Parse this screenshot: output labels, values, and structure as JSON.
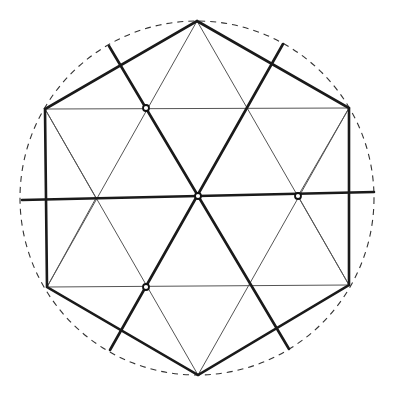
{
  "diagram": {
    "colors": {
      "ink": "#1a1a1a",
      "thin": "#555555",
      "background": "#ffffff"
    },
    "circle": {
      "cx": 197,
      "cy": 198,
      "r": 177,
      "style": "dashed"
    },
    "hexagon": {
      "vertices": [
        [
          197,
          21
        ],
        [
          349,
          108
        ],
        [
          349,
          285
        ],
        [
          198,
          375
        ],
        [
          47,
          287
        ],
        [
          45,
          109
        ]
      ]
    },
    "thin_lines": [
      [
        [
          45,
          109
        ],
        [
          349,
          108
        ]
      ],
      [
        [
          47,
          287
        ],
        [
          349,
          285
        ]
      ],
      [
        [
          197,
          21
        ],
        [
          47,
          287
        ]
      ],
      [
        [
          197,
          21
        ],
        [
          349,
          285
        ]
      ],
      [
        [
          198,
          375
        ],
        [
          45,
          109
        ]
      ],
      [
        [
          198,
          375
        ],
        [
          349,
          108
        ]
      ],
      [
        [
          45,
          109
        ],
        [
          96,
          198
        ]
      ],
      [
        [
          349,
          108
        ],
        [
          298,
          196
        ]
      ],
      [
        [
          47,
          287
        ],
        [
          96,
          198
        ]
      ],
      [
        [
          349,
          285
        ],
        [
          298,
          196
        ]
      ]
    ],
    "thick_lines": [
      {
        "name": "horizontal-axis",
        "from": [
          22,
          200
        ],
        "to": [
          374,
          192
        ]
      },
      {
        "name": "diagonal-upper-left-to-lower-right",
        "from": [
          109,
          46
        ],
        "to": [
          289,
          349
        ]
      },
      {
        "name": "diagonal-upper-right-to-lower-left",
        "from": [
          283,
          44
        ],
        "to": [
          110,
          350
        ]
      }
    ],
    "markers": [
      {
        "name": "marker-upper-left",
        "x": 146,
        "y": 108
      },
      {
        "name": "marker-center",
        "x": 198,
        "y": 196
      },
      {
        "name": "marker-right",
        "x": 298,
        "y": 196
      },
      {
        "name": "marker-lower-left",
        "x": 146,
        "y": 287
      }
    ]
  }
}
